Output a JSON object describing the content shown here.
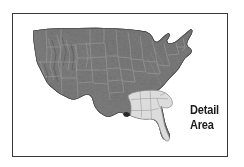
{
  "figure": {
    "kind": "reference-map",
    "frame_color": "#3a3a3a",
    "background_color": "#ffffff"
  },
  "map": {
    "region": "Contiguous United States",
    "style": "grayscale shaded relief with state boundaries",
    "base_fill": "#6f6f6f",
    "relief_dark": "#2e2e2e",
    "relief_light": "#a8a8a8",
    "state_line_color": "#9a9a9a",
    "coast_line_color": "#4a4a4a"
  },
  "detail_area": {
    "label_lines": [
      "Detail",
      "Area"
    ],
    "highlight_fill": "#dcdcdc",
    "highlight_stroke": "#8a8a8a",
    "text_color": "#1c1c1c",
    "states": [
      "Mississippi",
      "Alabama",
      "Georgia",
      "Florida",
      "South Carolina"
    ]
  }
}
